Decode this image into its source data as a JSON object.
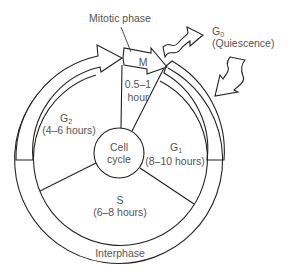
{
  "diagram": {
    "title": "Cell cycle",
    "center_label": [
      "Cell",
      "cycle"
    ],
    "ring_label": "Interphase",
    "mitotic_label": "Mitotic phase",
    "phases": [
      {
        "name": "M",
        "duration": [
          "0.5–1",
          "hour"
        ]
      },
      {
        "name": "G",
        "subscript": "1",
        "duration": "(8–10 hours)"
      },
      {
        "name": "S",
        "duration": "(6–8 hours)"
      },
      {
        "name": "G",
        "subscript": "2",
        "duration": "(4–6 hours)"
      }
    ],
    "g0": {
      "name": "G",
      "subscript": "0",
      "description": "(Quiescence)"
    },
    "colors": {
      "line": "#222222",
      "text": "#555555",
      "background": "#ffffff"
    }
  }
}
